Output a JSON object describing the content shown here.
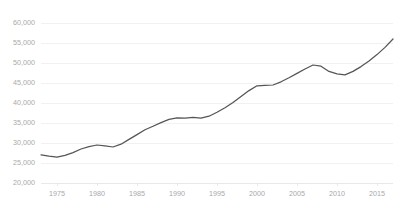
{
  "chart_data": {
    "type": "line",
    "title": "",
    "subtitle": "",
    "xlabel": "",
    "ylabel": "",
    "grid": true,
    "legend": false,
    "legend_position": "none",
    "line_color": "#555555",
    "axis_label_color": "#a9a9a9",
    "gridline_color": "#ededed",
    "xlim": [
      1973,
      2017
    ],
    "ylim": [
      20000,
      60000
    ],
    "xticks": [
      1975,
      1980,
      1985,
      1990,
      1995,
      2000,
      2005,
      2010,
      2015
    ],
    "xtick_labels": [
      "1975",
      "1980",
      "1985",
      "1990",
      "1995",
      "2000",
      "2005",
      "2010",
      "2015"
    ],
    "yticks": [
      20000,
      25000,
      30000,
      35000,
      40000,
      45000,
      50000,
      55000,
      60000
    ],
    "ytick_labels": [
      "20,000",
      "25,000",
      "30,000",
      "35,000",
      "40,000",
      "45,000",
      "50,000",
      "55,000",
      "60,000"
    ],
    "series": [
      {
        "name": "series-1",
        "color": "#555555",
        "x": [
          1973,
          1974,
          1975,
          1976,
          1977,
          1978,
          1979,
          1980,
          1981,
          1982,
          1983,
          1984,
          1985,
          1986,
          1987,
          1988,
          1989,
          1990,
          1991,
          1992,
          1993,
          1994,
          1995,
          1996,
          1997,
          1998,
          1999,
          2000,
          2001,
          2002,
          2003,
          2004,
          2005,
          2006,
          2007,
          2008,
          2009,
          2010,
          2011,
          2012,
          2013,
          2014,
          2015,
          2016,
          2017
        ],
        "values": [
          27050,
          26700,
          26450,
          26900,
          27600,
          28500,
          29100,
          29500,
          29300,
          29000,
          29700,
          30900,
          32100,
          33300,
          34200,
          35100,
          35900,
          36300,
          36200,
          36400,
          36200,
          36700,
          37700,
          38800,
          40100,
          41600,
          43100,
          44300,
          44400,
          44500,
          45300,
          46300,
          47400,
          48500,
          49500,
          49200,
          47900,
          47300,
          47050,
          47900,
          49100,
          50500,
          52100,
          53900,
          56000
        ]
      }
    ]
  }
}
